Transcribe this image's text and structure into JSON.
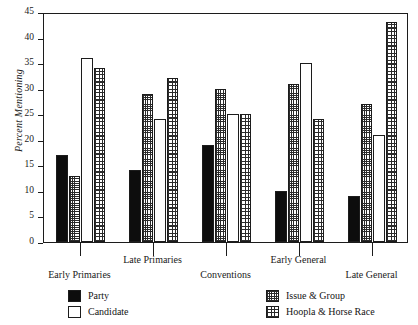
{
  "chart_data": {
    "type": "bar",
    "title": "",
    "xlabel": "",
    "ylabel": "Percent Mentioning",
    "ylim": [
      0,
      45
    ],
    "yticks": [
      0,
      5,
      10,
      15,
      20,
      25,
      30,
      35,
      40,
      45
    ],
    "grid": false,
    "legend_position": "below-plot",
    "categories": [
      "Early Primaries",
      "Late Primaries",
      "Conventions",
      "Early General",
      "Late General"
    ],
    "series": [
      {
        "name": "Party",
        "fill": "solid",
        "values": [
          17,
          14,
          19,
          10,
          9
        ]
      },
      {
        "name": "Issue & Group",
        "fill": "fine",
        "values": [
          13,
          29,
          30,
          31,
          27
        ]
      },
      {
        "name": "Candidate",
        "fill": "hollow",
        "values": [
          36,
          24,
          25,
          35,
          21
        ]
      },
      {
        "name": "Hoopla & Horse Race",
        "fill": "coarse",
        "values": [
          34,
          32,
          25,
          24,
          43
        ]
      }
    ]
  },
  "legend": {
    "entries": [
      {
        "label": "Party",
        "fill": "solid"
      },
      {
        "label": "Candidate",
        "fill": "hollow"
      },
      {
        "label": "Issue & Group",
        "fill": "fine"
      },
      {
        "label": "Hoopla & Horse Race",
        "fill": "coarse"
      }
    ]
  }
}
